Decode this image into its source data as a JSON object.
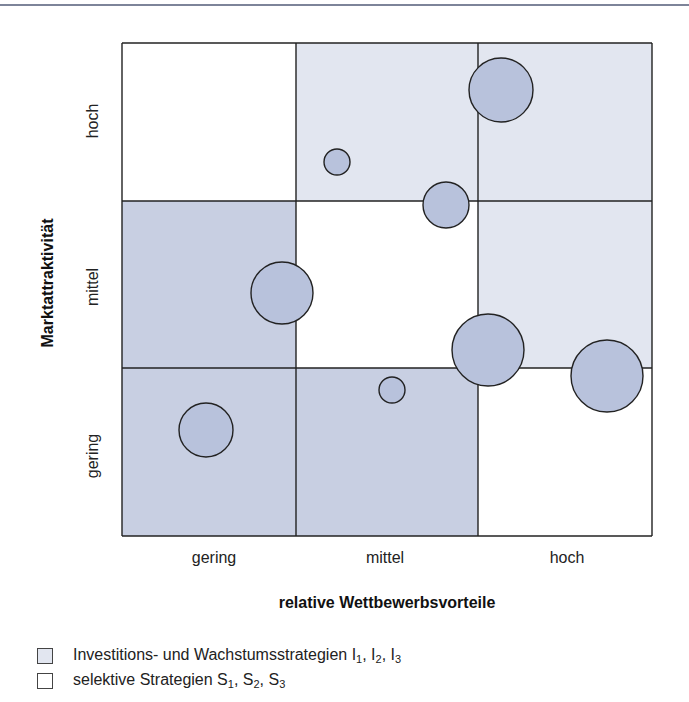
{
  "chart_data": {
    "type": "portfolio-matrix",
    "title": "",
    "xlabel": "relative Wettbewerbsvorteile",
    "ylabel": "Marktattraktivität",
    "x_categories": [
      "gering",
      "mittel",
      "hoch"
    ],
    "y_categories": [
      "gering",
      "mittel",
      "hoch"
    ],
    "cells": [
      {
        "x": "gering",
        "y": "hoch",
        "strategy": "selective"
      },
      {
        "x": "mittel",
        "y": "hoch",
        "strategy": "investment"
      },
      {
        "x": "hoch",
        "y": "hoch",
        "strategy": "investment"
      },
      {
        "x": "gering",
        "y": "mittel",
        "strategy": "skim"
      },
      {
        "x": "mittel",
        "y": "mittel",
        "strategy": "selective"
      },
      {
        "x": "hoch",
        "y": "mittel",
        "strategy": "investment"
      },
      {
        "x": "gering",
        "y": "gering",
        "strategy": "skim"
      },
      {
        "x": "mittel",
        "y": "gering",
        "strategy": "skim"
      },
      {
        "x": "hoch",
        "y": "gering",
        "strategy": "selective"
      }
    ],
    "bubbles": [
      {
        "cx": 501,
        "cy": 90,
        "r": 32
      },
      {
        "cx": 337,
        "cy": 162,
        "r": 13
      },
      {
        "cx": 446,
        "cy": 205,
        "r": 23
      },
      {
        "cx": 282,
        "cy": 293,
        "r": 31
      },
      {
        "cx": 488,
        "cy": 350,
        "r": 36
      },
      {
        "cx": 607,
        "cy": 376,
        "r": 36
      },
      {
        "cx": 392,
        "cy": 390,
        "r": 13
      },
      {
        "cx": 206,
        "cy": 430,
        "r": 27
      }
    ],
    "legend": [
      {
        "label": "Investitions- und Wachstumsstrategien I1, I2, I3",
        "color": "#e2e6f0"
      },
      {
        "label": "selektive Strategien S1, S2, S3",
        "color": "#ffffff"
      }
    ]
  },
  "colors": {
    "investment": "#e2e6f0",
    "skim": "#c8cfe2",
    "selective": "#ffffff",
    "bubble_fill": "#b8c2dc",
    "line": "#222222"
  },
  "axes": {
    "x": {
      "title": "relative Wettbewerbsvorteile",
      "ticks": [
        "gering",
        "mittel",
        "hoch"
      ]
    },
    "y": {
      "title": "Marktattraktivität",
      "ticks": [
        "hoch",
        "mittel",
        "gering"
      ]
    }
  },
  "legend": {
    "item1": {
      "text": "Investitions- und Wachstumsstrategien I",
      "subs": [
        "1",
        "2",
        "3"
      ]
    },
    "item2": {
      "text": "selektive Strategien S",
      "subs": [
        "1",
        "2",
        "3"
      ]
    },
    "item1_letter": "I",
    "item2_letter": "S",
    "sep": ", "
  }
}
